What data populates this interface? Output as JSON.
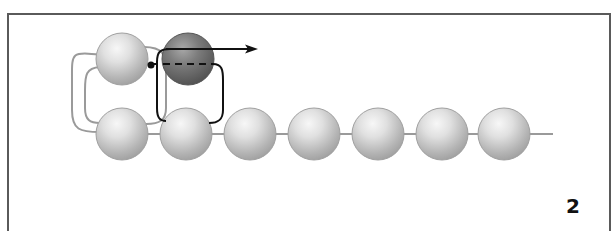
{
  "figure": {
    "step_number": "2",
    "colors": {
      "frame": "#5a5a5a",
      "bead_light": "#c9c9c9",
      "bead_highlight": "#f4f4f4",
      "bead_dark": "#6b6b6b",
      "thread_gray": "#9a9a9a",
      "thread_black": "#111111"
    },
    "beads": {
      "bottom_row_count": 7,
      "top_row": [
        {
          "name": "existing-bead",
          "shade": "light"
        },
        {
          "name": "new-bead",
          "shade": "dark"
        }
      ]
    },
    "annotations": {
      "arrow": "direction-of-thread-pull",
      "dashed_lines": "thread-path-through-bead",
      "dot": "needle-entry-point"
    }
  }
}
